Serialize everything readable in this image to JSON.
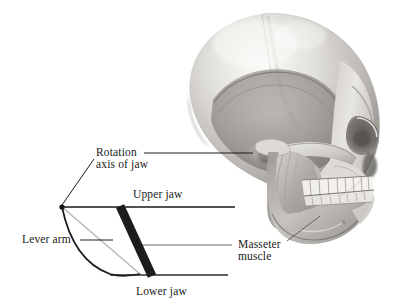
{
  "figure": {
    "background_color": "#ffffff",
    "ink_color": "#1a1a1a",
    "muscle_bar_color": "#1c1c1c",
    "lever_arm_color": "#b9b9b9",
    "width": 396,
    "height": 308
  },
  "labels": {
    "rotation_axis_line1": "Rotation",
    "rotation_axis_line2": "axis of jaw",
    "upper_jaw": "Upper jaw",
    "lever_arm": "Lever arm",
    "lower_jaw": "Lower jaw",
    "masseter_line1": "Masseter",
    "masseter_line2": "muscle"
  },
  "diagram": {
    "pivot_point": {
      "x": 62,
      "y": 207
    },
    "upper_jaw_line": {
      "x1": 62,
      "y1": 207,
      "x2": 235,
      "y2": 207
    },
    "masseter_leader_line": {
      "x1": 135,
      "y1": 245,
      "x2": 232,
      "y2": 245
    },
    "lower_jaw_line": {
      "x1": 110,
      "y1": 275,
      "x2": 228,
      "y2": 275
    },
    "muscle_bar": {
      "top_x": 120,
      "top_y": 207,
      "bottom_x": 152,
      "bottom_y": 275,
      "width": 9
    },
    "lever_arm_segment": {
      "x1": 62,
      "y1": 207,
      "x2": 137,
      "y2": 273
    },
    "mandible_curve": {
      "from_x": 62,
      "from_y": 207,
      "to_x": 137,
      "to_y": 274
    },
    "rotation_leader_horizontal": {
      "x1": 145,
      "y1": 153,
      "x2": 252,
      "y2": 153
    },
    "rotation_leader_diagonal": {
      "x1": 93,
      "y1": 160,
      "x2": 62,
      "y2": 206
    },
    "lever_arm_leader": {
      "x1": 80,
      "y1": 240,
      "x2": 108,
      "y2": 240
    },
    "masseter_skull_leader": {
      "x1": 288,
      "y1": 240,
      "x2": 318,
      "y2": 218
    }
  },
  "skull": {
    "description": "grayscale photographic rendering of a human skull in right lateral view with masseter muscle shown over the mandible",
    "tone_light": "#f2f1ef",
    "tone_mid": "#b4b2ae",
    "tone_dark": "#5c5a57",
    "bounds": {
      "x": 185,
      "y": 12,
      "width": 205,
      "height": 222
    }
  }
}
